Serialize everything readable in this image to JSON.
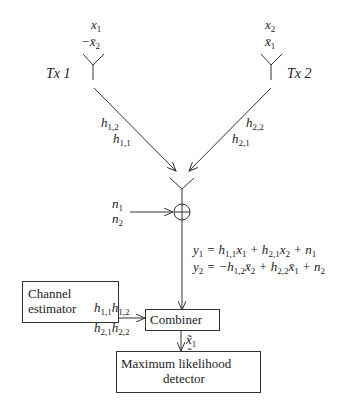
{
  "diagram": {
    "tx1": {
      "label": "Tx 1",
      "symbols": [
        "x1",
        "−x̄2"
      ]
    },
    "tx2": {
      "label": "Tx 2",
      "symbols": [
        "x2",
        "x̄1"
      ]
    },
    "channels": {
      "tx1": [
        "h1,2",
        "h1,1"
      ],
      "tx2": [
        "h2,2",
        "h2,1"
      ]
    },
    "noise": [
      "n1",
      "n2"
    ],
    "equations": [
      "y1 = h1,1 x1 + h2,1 x2 + n1",
      "y2 = −h1,2 x̄2 + h2,2 x̄1 + n2"
    ],
    "channel_estimator": {
      "line1": "Channel",
      "line2": "estimator",
      "outputs": [
        "h1,1 h1,2",
        "h2,1 h2,2"
      ]
    },
    "combiner": {
      "label": "Combiner",
      "outputs": [
        "x̃1",
        "x̃2"
      ]
    },
    "detector": {
      "line1": "Maximum likelihood",
      "line2": "detector"
    }
  }
}
